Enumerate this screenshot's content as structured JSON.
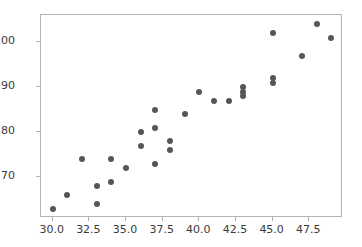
{
  "chart_data": {
    "type": "scatter",
    "title": "",
    "xlabel": "",
    "ylabel": "",
    "xlim": [
      29.2,
      49.8
    ],
    "ylim": [
      61.0,
      106.0
    ],
    "grid": false,
    "legend": null,
    "marker_color": "#565659",
    "spine_color": "#b4b4b4",
    "background_color": "#ffffff",
    "xticks": [
      30.0,
      32.5,
      35.0,
      37.5,
      40.0,
      42.5,
      45.0,
      47.5
    ],
    "xticklabels": [
      "30.0",
      "32.5",
      "35.0",
      "37.5",
      "40.0",
      "42.5",
      "45.0",
      "47.5"
    ],
    "yticks": [
      70,
      80,
      90,
      100
    ],
    "yticklabels": [
      "70",
      "80",
      "90",
      "100"
    ],
    "series": [
      {
        "name": "points",
        "x": [
          30,
          31,
          32,
          33,
          33,
          34,
          34,
          35,
          36,
          36,
          37,
          37,
          37,
          38,
          38,
          39,
          40,
          41,
          42,
          43,
          43,
          43,
          45,
          45,
          45,
          47,
          48,
          49
        ],
        "y": [
          63,
          66,
          74,
          68,
          64,
          74,
          69,
          72,
          80,
          77,
          85,
          81,
          73,
          78,
          76,
          84,
          89,
          87,
          87,
          90,
          89,
          88,
          102,
          92,
          91,
          97,
          104,
          101
        ]
      }
    ]
  }
}
